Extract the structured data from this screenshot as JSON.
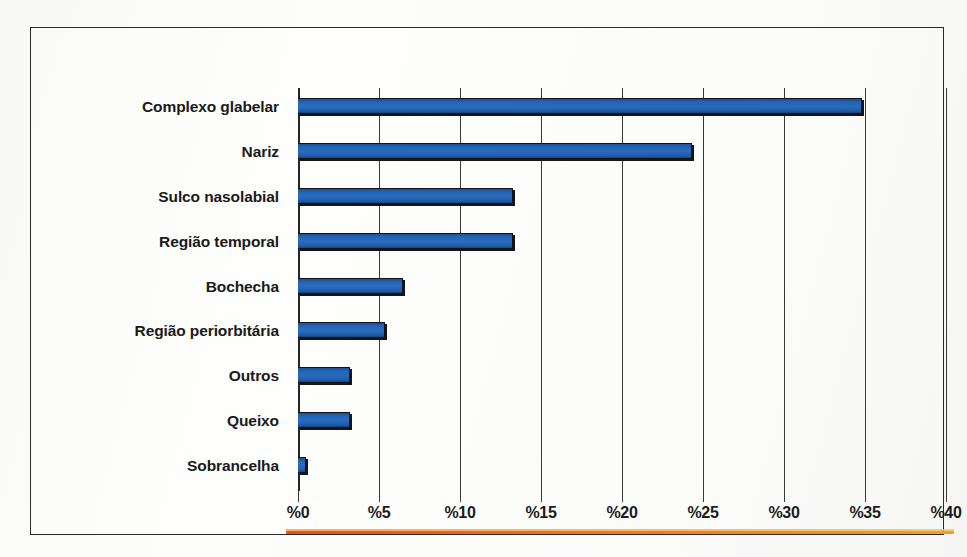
{
  "chart_data": {
    "type": "bar",
    "orientation": "horizontal",
    "title": "",
    "subtitle": "",
    "xlabel": "",
    "ylabel": "",
    "categories": [
      "Complexo glabelar",
      "Nariz",
      "Sulco nasolabial",
      "Região temporal",
      "Bochecha",
      "Região periorbitária",
      "Outros",
      "Queixo",
      "Sobrancelha"
    ],
    "values": [
      34.8,
      24.3,
      13.3,
      13.3,
      6.5,
      5.4,
      3.2,
      3.2,
      0.5
    ],
    "values_display": [
      "34.8",
      "24.3",
      "13.3",
      "13.3",
      "6.5",
      "5.4",
      "3.2",
      "3.2",
      "0.5"
    ],
    "xlim": [
      0,
      40
    ],
    "xticks": [
      0,
      5,
      10,
      15,
      20,
      25,
      30,
      35,
      40
    ],
    "xtick_labels": [
      "%0",
      "%5",
      "%10",
      "%15",
      "%20",
      "%25",
      "%30",
      "%35",
      "%40"
    ],
    "grid": "vertical",
    "legend": "none",
    "series": [
      {
        "name": "Frequência",
        "color": "#2565b4",
        "values": [
          34.8,
          24.3,
          13.3,
          13.3,
          6.5,
          5.4,
          3.2,
          3.2,
          0.5
        ]
      }
    ],
    "bar_count": 9
  },
  "colors": {
    "bar_fill": "#2565b4",
    "bar_fill_dark": "#16417a",
    "bar_outline": "#111417",
    "gridline": "#3a3a3a",
    "frame_border": "#2b2b2b",
    "label_text": "#1a1a1a",
    "accent_rule_start": "#ef4b18",
    "accent_rule_end": "#f9a52b",
    "background": "#fdfdfb"
  },
  "rows": [
    {
      "label": "Complexo glabelar",
      "value": 34.8
    },
    {
      "label": "Nariz",
      "value": 24.3
    },
    {
      "label": "Sulco nasolabial",
      "value": 13.3
    },
    {
      "label": "Região temporal",
      "value": 13.3
    },
    {
      "label": "Bochecha",
      "value": 6.5
    },
    {
      "label": "Região periorbitária",
      "value": 5.4
    },
    {
      "label": "Outros",
      "value": 3.2
    },
    {
      "label": "Queixo",
      "value": 3.2
    },
    {
      "label": "Sobrancelha",
      "value": 0.5
    }
  ],
  "axis": {
    "ticks": [
      "%0",
      "%5",
      "%10",
      "%15",
      "%20",
      "%25",
      "%30",
      "%35",
      "%40"
    ],
    "tick_values": [
      0,
      5,
      10,
      15,
      20,
      25,
      30,
      35,
      40
    ]
  }
}
